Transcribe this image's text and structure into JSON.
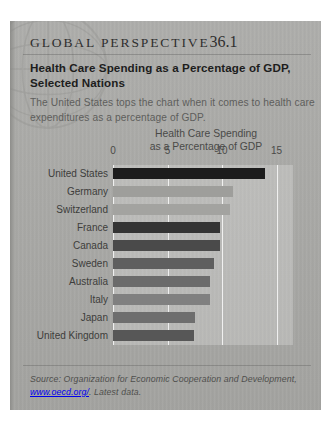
{
  "feature": {
    "kicker_label": "GLOBAL  PERSPECTIVE",
    "kicker_number": "36.1",
    "title": "Health Care Spending as a Percentage of GDP, Selected Nations",
    "blurb": "The United States tops the chart when it comes to health care expenditures as a percentage of GDP."
  },
  "source": {
    "lead": "Source:",
    "text": "Organization for Economic Cooperation and Development,",
    "url": "www.oecd.org/",
    "suffix": ". Latest data."
  },
  "colors": {
    "box_background": "#a9a9a6",
    "plot_background": "#b5b5b2",
    "gridline": "#ffffff",
    "text_dark": "#1d1d1d",
    "text_muted": "#5e5e5c"
  },
  "chart_data": {
    "type": "bar",
    "orientation": "horizontal",
    "title": "Health Care Spending\nas a Percentage of GDP",
    "title_line1": "Health Care Spending",
    "title_line2": "as a Percentage of GDP",
    "xlabel": "",
    "ylabel": "",
    "xlim": [
      0,
      16.5
    ],
    "xticks": [
      0,
      5,
      10,
      15
    ],
    "xtick_labels": [
      "0",
      "5",
      "10",
      "15"
    ],
    "grid": true,
    "legend": false,
    "categories": [
      "United States",
      "Germany",
      "Switzerland",
      "France",
      "Canada",
      "Sweden",
      "Australia",
      "Italy",
      "Japan",
      "United Kingdom"
    ],
    "values": [
      13.9,
      11.0,
      10.7,
      9.8,
      9.8,
      9.3,
      8.9,
      8.9,
      7.5,
      7.4
    ],
    "bar_colors": [
      "#1c1c1c",
      "#9e9e9b",
      "#a3a3a0",
      "#343434",
      "#4a4a4a",
      "#5f5f5f",
      "#6b6b6b",
      "#808080",
      "#6e6e6e",
      "#575757"
    ]
  }
}
